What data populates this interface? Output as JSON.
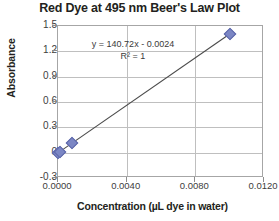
{
  "chart_data": {
    "type": "scatter",
    "title": "Red Dye at 495 nm Beer's Law Plot",
    "xlabel": "Concentration (µL dye in water)",
    "ylabel": "Absorbance",
    "xlim": [
      0.0,
      0.012
    ],
    "ylim": [
      -0.3,
      1.5
    ],
    "grid": true,
    "legend": "none",
    "x_tick_labels": [
      "0.0000",
      "0.0040",
      "0.0080",
      "0.0120"
    ],
    "x_tick_values": [
      0.0,
      0.004,
      0.008,
      0.012
    ],
    "y_tick_labels": [
      "1.5",
      "1.2",
      "0.9",
      "0.6",
      "0.3",
      "0",
      "-0.3"
    ],
    "y_tick_values": [
      1.5,
      1.2,
      0.9,
      0.6,
      0.3,
      0.0,
      -0.3
    ],
    "series": [
      {
        "name": "Red Dye Absorbance",
        "marker": "diamond",
        "color": "#7b86c4",
        "x": [
          0.0,
          0.0001,
          0.0008,
          0.01
        ],
        "y": [
          -0.002,
          0.012,
          0.11,
          1.405
        ]
      }
    ],
    "trendline": {
      "equation": "y = 140.72x - 0.0024",
      "r_squared_label": "R² = 1",
      "slope": 140.72,
      "intercept": -0.0024,
      "r_squared": 1,
      "color": "#4a4a4a"
    },
    "annotations": [
      "y = 140.72x - 0.0024",
      "R² = 1"
    ]
  }
}
